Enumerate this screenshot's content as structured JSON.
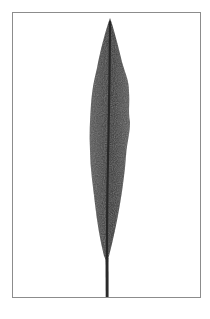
{
  "image": {
    "subject": "single lanceolate leaf with stem",
    "background_color": "#ffffff",
    "frame_color": "#8c8c8c",
    "leaf_color": "#4a4a4a",
    "leaf_dark_color": "#2a2a2a",
    "midrib_color": "#1e1e1e"
  }
}
